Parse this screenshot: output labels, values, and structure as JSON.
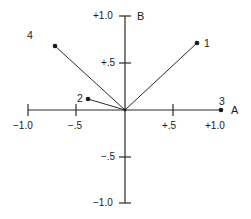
{
  "diagram": {
    "axes": {
      "x_label": "A",
      "y_label": "B",
      "x_ticks": [
        {
          "value": -1.0,
          "label": "−1.0"
        },
        {
          "value": -0.5,
          "label": "−.5"
        },
        {
          "value": 0.5,
          "label": "+.5"
        },
        {
          "value": 1.0,
          "label": "+1.0"
        }
      ],
      "y_ticks": [
        {
          "value": 1.0,
          "label": "+1.0"
        },
        {
          "value": 0.5,
          "label": "+.5"
        },
        {
          "value": -0.5,
          "label": "−.5"
        },
        {
          "value": -1.0,
          "label": "−1.0"
        }
      ]
    },
    "points": [
      {
        "id": "1",
        "label": "1",
        "a": 0.74,
        "b": 0.71
      },
      {
        "id": "2",
        "label": "2",
        "a": -0.38,
        "b": 0.12
      },
      {
        "id": "3",
        "label": "3",
        "a": 1.0,
        "b": 0.0
      },
      {
        "id": "4",
        "label": "4",
        "a": -0.72,
        "b": 0.68
      }
    ],
    "colors": {
      "line": "#2a2a2a",
      "text": "#1a1a1a"
    }
  }
}
